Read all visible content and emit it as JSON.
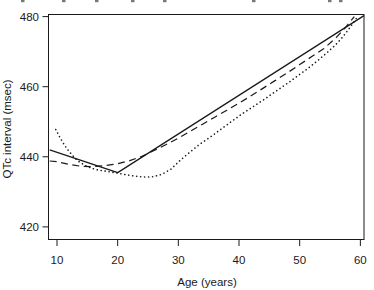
{
  "clipped_caption": {
    "description": "bottom slivers of a cropped caption text line, glyph descenders only, illegible",
    "fragment_x": [
      21,
      62,
      95,
      131,
      163,
      252,
      328,
      339
    ]
  },
  "chart_data": {
    "type": "line",
    "title": "",
    "xlabel": "Age (years)",
    "ylabel": "QTc interval (msec)",
    "xlim": [
      8.6,
      60.6
    ],
    "ylim": [
      416.4,
      480.6
    ],
    "xticks": [
      10,
      20,
      30,
      40,
      50,
      60
    ],
    "yticks": [
      420,
      440,
      460,
      480
    ],
    "grid": false,
    "legend": "none",
    "frame_color": "#1a1a1a",
    "series": [
      {
        "name": "solid-line",
        "style": "solid",
        "color": "#1a1a1a",
        "x": [
          8.8,
          20,
          60.6
        ],
        "y": [
          442,
          435.5,
          480.3
        ]
      },
      {
        "name": "dashed-line",
        "style": "dashed",
        "color": "#1a1a1a",
        "x": [
          8.8,
          10,
          12,
          14,
          16,
          18,
          20,
          22,
          24,
          26,
          28,
          30,
          32,
          34,
          36,
          38,
          40,
          42,
          44,
          46,
          48,
          50,
          52,
          54,
          56,
          57.5,
          59
        ],
        "y": [
          438.8,
          438.6,
          437.8,
          437.3,
          437.2,
          437.5,
          438,
          438.9,
          440.1,
          441.8,
          443.5,
          445.3,
          447.3,
          449.3,
          451.3,
          453.3,
          455.3,
          457.4,
          459.6,
          461.8,
          464,
          466.3,
          468.6,
          470.9,
          474,
          476.8,
          480
        ]
      },
      {
        "name": "dotted-line",
        "style": "dotted",
        "color": "#1a1a1a",
        "x": [
          9.8,
          10.4,
          11,
          11.6,
          12.3,
          13,
          13.8,
          14.8,
          15.8,
          16.8,
          18.3,
          19.8,
          21.3,
          22.8,
          24.3,
          25.8,
          27.3,
          28.8,
          30.3,
          31.8,
          33.3,
          35,
          36.5,
          38,
          39.5,
          41,
          42.5,
          44,
          45.5,
          47,
          48.5,
          50,
          51.5,
          53,
          54.5,
          56,
          57,
          58,
          59,
          59.6
        ],
        "y": [
          447.8,
          445.8,
          444,
          442.4,
          440.9,
          439.5,
          438.4,
          437.4,
          436.7,
          436.2,
          435.8,
          435.4,
          434.9,
          434.5,
          434.2,
          434.3,
          435,
          436.5,
          439,
          441.2,
          443.3,
          445.3,
          447.2,
          449.1,
          451,
          452.8,
          454.5,
          456.2,
          458,
          459.8,
          461.6,
          463.5,
          465.4,
          467.5,
          469.7,
          472.1,
          474,
          476.2,
          478.6,
          480.2
        ]
      }
    ]
  }
}
